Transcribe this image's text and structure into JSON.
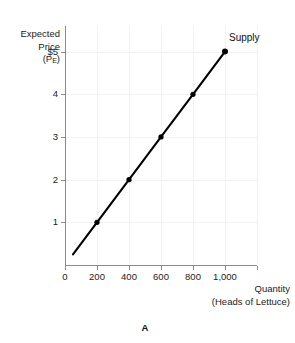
{
  "panel": {
    "label": "A"
  },
  "chart_data": {
    "type": "line",
    "title": "",
    "subtitle": "",
    "xlabel": "Quantity",
    "xlabel_sub": "(Heads of Lettuce)",
    "ylabel_lines": [
      "Expected",
      "Price"
    ],
    "ylabel_symbol_base": "(P",
    "ylabel_symbol_sub": "E",
    "ylabel_symbol_close": ")",
    "xlim": [
      0,
      1200
    ],
    "ylim": [
      0,
      5.6
    ],
    "grid": true,
    "legend_position": "inline-right-of-endpoint",
    "x_ticks": [
      0,
      200,
      400,
      600,
      800,
      1000,
      1200
    ],
    "x_ticklabels": [
      "0",
      "200",
      "400",
      "600",
      "800",
      "1,000",
      ""
    ],
    "y_ticks": [
      1,
      2,
      3,
      4,
      5
    ],
    "y_ticklabels": [
      "1",
      "2",
      "3",
      "4",
      "$5"
    ],
    "series": [
      {
        "name": "Supply",
        "marker": "filled-circle",
        "color": "#000000",
        "x": [
          200,
          400,
          600,
          800,
          1000
        ],
        "y": [
          1,
          2,
          3,
          4,
          5
        ],
        "line_extends_to": {
          "x": 50,
          "y": 0.25
        },
        "annotation": "Supply"
      }
    ]
  }
}
